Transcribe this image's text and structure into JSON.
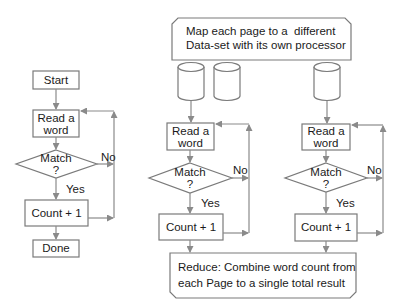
{
  "colors": {
    "line": "#8a8a8a",
    "box_stroke": "#777777",
    "text": "#1a1a1a",
    "background": "#ffffff"
  },
  "sequential": {
    "start": "Start",
    "read_line1": "Read a",
    "read_line2": "word",
    "match_line1": "Match",
    "match_line2": "?",
    "no": "No",
    "yes": "Yes",
    "count": "Count + 1",
    "done": "Done"
  },
  "parallel": {
    "map_line1": "Map each page to a  different",
    "map_line2": "Data-set with its own processor",
    "processors": [
      {
        "read_line1": "Read a",
        "read_line2": "word",
        "match_line1": "Match",
        "match_line2": "?",
        "no": "No",
        "yes": "Yes",
        "count": "Count + 1"
      },
      {
        "read_line1": "Read a",
        "read_line2": "word",
        "match_line1": "Match",
        "match_line2": "?",
        "no": "No",
        "yes": "Yes",
        "count": "Count + 1"
      }
    ],
    "reduce_line1": "Reduce: Combine word count from",
    "reduce_line2": "each Page to a single total result"
  }
}
